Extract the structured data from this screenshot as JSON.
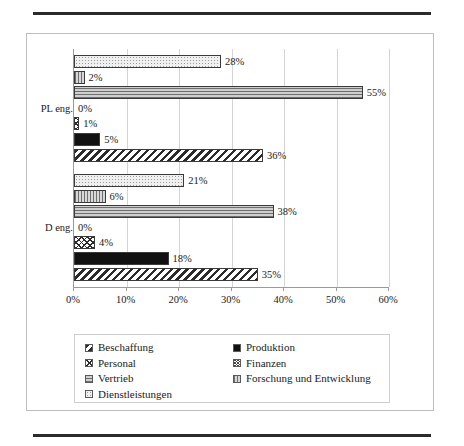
{
  "document": {
    "rule_top": "horizontal-rule",
    "rule_bottom": "horizontal-rule"
  },
  "chart_data": {
    "type": "bar",
    "orientation": "horizontal",
    "title": "",
    "xlabel": "",
    "ylabel": "",
    "categories": [
      "PL eng.",
      "D eng."
    ],
    "xlim": [
      0,
      60
    ],
    "xticks": [
      "0%",
      "10%",
      "20%",
      "30%",
      "40%",
      "50%",
      "60%"
    ],
    "xtick_values": [
      0,
      10,
      20,
      30,
      40,
      50,
      60
    ],
    "grid": true,
    "legend_position": "bottom",
    "value_suffix": "%",
    "series": [
      {
        "name": "Beschaffung",
        "pattern": "diagonal-stripes",
        "values": [
          36,
          35
        ],
        "labels": [
          "36%",
          "35%"
        ]
      },
      {
        "name": "Produktion",
        "pattern": "solid-black",
        "values": [
          5,
          18
        ],
        "labels": [
          "5%",
          "18%"
        ]
      },
      {
        "name": "Personal",
        "pattern": "cross-hatch",
        "values": [
          1,
          4
        ],
        "labels": [
          "1%",
          "4%"
        ]
      },
      {
        "name": "Finanzen",
        "pattern": "dense-cross-hatch",
        "values": [
          0,
          0
        ],
        "labels": [
          "0%",
          "0%"
        ]
      },
      {
        "name": "Vertrieb",
        "pattern": "horizontal-lines",
        "values": [
          55,
          38
        ],
        "labels": [
          "55%",
          "38%"
        ]
      },
      {
        "name": "Forschung und Entwicklung",
        "pattern": "vertical-lines",
        "values": [
          2,
          6
        ],
        "labels": [
          "2%",
          "6%"
        ]
      },
      {
        "name": "Dienstleistungen",
        "pattern": "light-dots",
        "values": [
          28,
          21
        ],
        "labels": [
          "28%",
          "21%"
        ]
      }
    ]
  },
  "legend": {
    "left_column": [
      {
        "label": "Beschaffung",
        "swatch": "diagonal-stripes-swatch"
      },
      {
        "label": "Personal",
        "swatch": "cross-hatch-swatch"
      },
      {
        "label": "Vertrieb",
        "swatch": "horizontal-lines-swatch"
      },
      {
        "label": "Dienstleistungen",
        "swatch": "light-dots-swatch"
      }
    ],
    "right_column": [
      {
        "label": "Produktion",
        "swatch": "solid-black-swatch"
      },
      {
        "label": "Finanzen",
        "swatch": "dense-cross-hatch-swatch"
      },
      {
        "label": "Forschung und Entwicklung",
        "swatch": "vertical-lines-swatch"
      }
    ]
  }
}
